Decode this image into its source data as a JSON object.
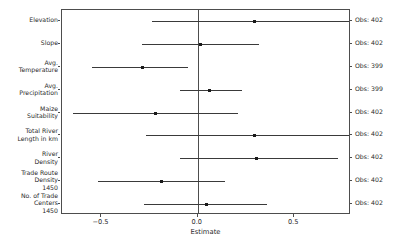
{
  "chart_data": {
    "type": "scatter",
    "title": "",
    "xlabel": "Estimate",
    "ylabel": "",
    "xlim": [
      -0.705,
      0.795
    ],
    "xticks": [
      -0.5,
      0.0,
      0.5
    ],
    "xticklabels": [
      "−0.5",
      "0.0",
      "0.5"
    ],
    "grid": false,
    "legend": null,
    "reference_line": 0.0,
    "categories": [
      "Elevation",
      "Slope",
      "Avg.\nTemperature",
      "Avg.\nPrecipitation",
      "Maize\nSuitability",
      "Total River\nLength in km",
      "River\nDensity",
      "Trade Route\nDensity\n1450",
      "No. of Trade\nCenters\n1450"
    ],
    "points": [
      {
        "label": "Elevation",
        "estimate": 0.29,
        "ci_low": -0.24,
        "ci_high": 0.8,
        "obs": "Obs: 402"
      },
      {
        "label": "Slope",
        "estimate": 0.01,
        "ci_low": -0.29,
        "ci_high": 0.32,
        "obs": "Obs: 402"
      },
      {
        "label": "Avg. Temperature",
        "estimate": -0.29,
        "ci_low": -0.55,
        "ci_high": -0.05,
        "obs": "Obs: 399"
      },
      {
        "label": "Avg. Precipitation",
        "estimate": 0.06,
        "ci_low": -0.09,
        "ci_high": 0.23,
        "obs": "Obs: 399"
      },
      {
        "label": "Maize Suitability",
        "estimate": -0.22,
        "ci_low": -0.65,
        "ci_high": 0.21,
        "obs": "Obs: 402"
      },
      {
        "label": "Total River Length in km",
        "estimate": 0.29,
        "ci_low": -0.27,
        "ci_high": 0.82,
        "obs": "Obs: 402"
      },
      {
        "label": "River Density",
        "estimate": 0.3,
        "ci_low": -0.09,
        "ci_high": 0.73,
        "obs": "Obs: 402"
      },
      {
        "label": "Trade Route Density 1450",
        "estimate": -0.19,
        "ci_low": -0.52,
        "ci_high": 0.14,
        "obs": "Obs: 402"
      },
      {
        "label": "No. of Trade Centers 1450",
        "estimate": 0.04,
        "ci_low": -0.28,
        "ci_high": 0.36,
        "obs": "Obs: 402"
      }
    ]
  },
  "axis": {
    "x_title": "Estimate",
    "tick_labels": [
      "−0.5",
      "0.0",
      "0.5"
    ],
    "tick_values": [
      -0.5,
      0,
      0.5
    ]
  },
  "y_labels": [
    [
      "Elevation"
    ],
    [
      "Slope"
    ],
    [
      "Avg.",
      "Temperature"
    ],
    [
      "Avg.",
      "Precipitation"
    ],
    [
      "Maize",
      "Suitability"
    ],
    [
      "Total River",
      "Length in km"
    ],
    [
      "River",
      "Density"
    ],
    [
      "Trade Route",
      "Density",
      "1450"
    ],
    [
      "No. of Trade",
      "Centers",
      "1450"
    ]
  ],
  "obs_labels": [
    "Obs: 402",
    "Obs: 402",
    "Obs: 399",
    "Obs: 399",
    "Obs: 402",
    "Obs: 402",
    "Obs: 402",
    "Obs: 402",
    "Obs: 402"
  ],
  "colors": {
    "point": "#1a1a1a",
    "interval": "#3a3a3a",
    "axis": "#4d4d4d",
    "text": "#2b2b2b",
    "background": "#ffffff"
  }
}
